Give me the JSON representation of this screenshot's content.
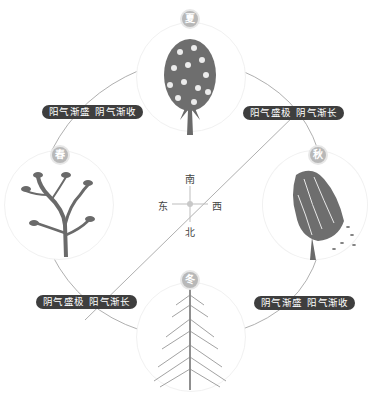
{
  "diagram": {
    "seasons": [
      {
        "id": "summer",
        "badge": "夏",
        "icon": "lush-tree-icon"
      },
      {
        "id": "spring",
        "badge": "春",
        "icon": "sprouting-tree-icon"
      },
      {
        "id": "autumn",
        "badge": "秋",
        "icon": "windblown-tree-icon"
      },
      {
        "id": "winter",
        "badge": "冬",
        "icon": "pine-tree-icon"
      }
    ],
    "labels": {
      "top_left": [
        "阳气渐盛",
        "阴气渐收"
      ],
      "top_right": [
        "阳气盛极",
        "阴气渐长"
      ],
      "bottom_left": [
        "阴气盛极",
        "阳气渐长"
      ],
      "bottom_right": [
        "阴气渐盛",
        "阳气渐收"
      ]
    },
    "compass": {
      "north_label": "北",
      "south_label": "南",
      "east_label": "东",
      "west_label": "西"
    },
    "colors": {
      "pill_bg": "#3e3e3e",
      "badge_bg": "#b8b8b8",
      "line": "#9a9a9a",
      "tree": "#6a6a6a"
    }
  }
}
